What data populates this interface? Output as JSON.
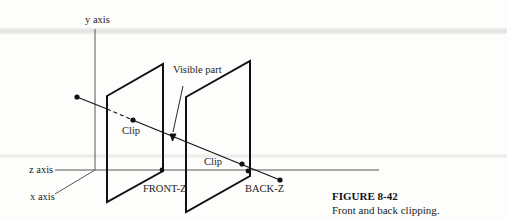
{
  "figure": {
    "number": "FIGURE 8-42",
    "caption": "Front and back clipping."
  },
  "labels": {
    "y_axis": "y axis",
    "z_axis": "z axis",
    "x_axis": "x axis",
    "visible_part": "Visible part",
    "clip_front": "Clip",
    "clip_back": "Clip",
    "front_z": "FRONT-Z",
    "back_z": "BACK-Z"
  },
  "colors": {
    "stroke": "#111111",
    "axis": "#444444",
    "text": "#222222"
  }
}
